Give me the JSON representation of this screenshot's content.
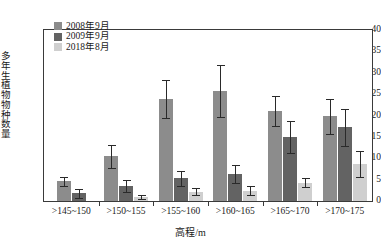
{
  "chart_data": {
    "type": "bar",
    "title": "",
    "xlabel": "高程/m",
    "ylabel": "多年生植物物种数量",
    "categories": [
      ">145~150",
      ">150~155",
      ">155~160",
      ">160~165",
      ">165~170",
      ">170~175"
    ],
    "ylim": [
      0,
      40
    ],
    "ytick_labels": [
      "0",
      "5",
      "10",
      "15",
      "20",
      "25",
      "30",
      "35",
      "40"
    ],
    "yticks": [
      0,
      5,
      10,
      15,
      20,
      25,
      30,
      35,
      40
    ],
    "grid": false,
    "legend_position": "top-left",
    "error_bars": "standard deviation",
    "series": [
      {
        "name": "2008年9月",
        "color": "#8c8c8c",
        "values": [
          4.6,
          10.5,
          23.8,
          25.8,
          21.0,
          19.8
        ],
        "errors": [
          1.0,
          2.7,
          4.5,
          6.1,
          3.5,
          4.1
        ]
      },
      {
        "name": "2009年9月",
        "color": "#636363",
        "values": [
          1.8,
          3.4,
          5.3,
          6.4,
          14.9,
          17.2
        ],
        "errors": [
          1.1,
          1.4,
          1.7,
          2.1,
          3.7,
          4.4
        ]
      },
      {
        "name": "2018年8月",
        "color": "#cfcfcf",
        "values": [
          null,
          0.9,
          2.2,
          2.4,
          4.3,
          8.7
        ],
        "errors": [
          null,
          0.4,
          0.9,
          1.0,
          1.1,
          3.1
        ]
      }
    ]
  },
  "legend": {
    "items": [
      {
        "label": "2008年9月",
        "color": "#8c8c8c"
      },
      {
        "label": "2009年9月",
        "color": "#636363"
      },
      {
        "label": "2018年8月",
        "color": "#cfcfcf"
      }
    ]
  },
  "axes": {
    "y_title": "多年生植物物种数量",
    "x_title": "高程/m",
    "y_tick_labels": [
      "40",
      "35",
      "30",
      "25",
      "20",
      "15",
      "10",
      "5",
      "0"
    ],
    "x_tick_labels": [
      ">145~150",
      ">150~155",
      ">155~160",
      ">160~165",
      ">165~170",
      ">170~175"
    ]
  },
  "colors": {
    "axis": "#3a3a3a",
    "text": "#1a1a1a",
    "series_2008": "#8c8c8c",
    "series_2009": "#636363",
    "series_2018": "#cfcfcf",
    "error_bar": "#2a2a2a",
    "background": "#ffffff"
  }
}
